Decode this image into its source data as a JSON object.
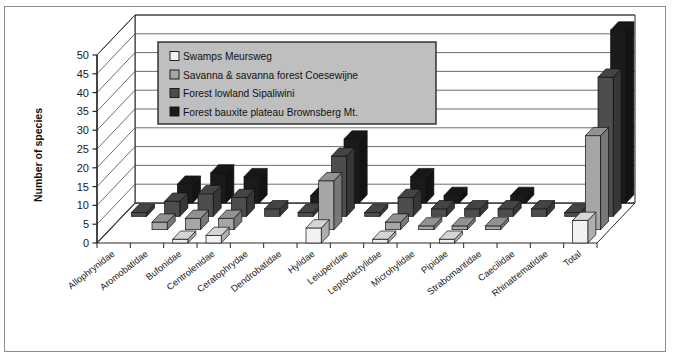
{
  "chart_data": {
    "type": "bar",
    "title": "",
    "subtitle": "",
    "xlabel": "",
    "ylabel": "Number of species",
    "ylim": [
      0,
      50
    ],
    "ytick_step": 5,
    "yticks": [
      0,
      5,
      10,
      15,
      20,
      25,
      30,
      35,
      40,
      45,
      50
    ],
    "grid": true,
    "three_d": true,
    "legend_position": "top-left-inside",
    "categories": [
      "Allophrynidae",
      "Aromobatidae",
      "Bufonidae",
      "Centrolenidae",
      "Ceratophrydae",
      "Dendrobatidae",
      "Hylidae",
      "Leiuperidae",
      "Leptodactylidae",
      "Microhylidae",
      "Pipidae",
      "Strabomantidae",
      "Caecilidae",
      "Rhinatrematidae",
      "Total"
    ],
    "series": [
      {
        "name": "Swamps Meursweg",
        "color": "#f2f2f2",
        "values": [
          0,
          0,
          1,
          2,
          0,
          0,
          4,
          0,
          1,
          0,
          1,
          0,
          0,
          0,
          6
        ]
      },
      {
        "name": "Savanna & savanna forest Coesewijne",
        "color": "#a6a6a6",
        "values": [
          0,
          2,
          3,
          3,
          0,
          0,
          13,
          0,
          2,
          1,
          1,
          1,
          0,
          0,
          25
        ]
      },
      {
        "name": "Forest lowland Sipaliwini",
        "color": "#4d4d4d",
        "values": [
          1,
          4,
          6,
          5,
          2,
          1,
          16,
          1,
          5,
          2,
          2,
          2,
          2,
          1,
          37
        ]
      },
      {
        "name": "Forest bauxite plateau Brownsberg Mt.",
        "color": "#1a1a1a",
        "values": [
          0,
          5,
          8,
          7,
          0,
          2,
          17,
          0,
          7,
          2,
          0,
          2,
          0,
          0,
          46
        ]
      }
    ]
  },
  "legend": {
    "items": [
      "Swamps Meursweg",
      "Savanna & savanna forest Coesewijne",
      "Forest lowland Sipaliwini",
      "Forest bauxite plateau Brownsberg Mt."
    ],
    "background": "#bfbfbf",
    "border": "#1a1a1a"
  },
  "axes": {
    "y_title": "Number of species",
    "y_tick_labels": [
      "0",
      "5",
      "10",
      "15",
      "20",
      "25",
      "30",
      "35",
      "40",
      "45",
      "50"
    ],
    "x_tick_labels": [
      "Allophrynidae",
      "Aromobatidae",
      "Bufonidae",
      "Centrolenidae",
      "Ceratophrydae",
      "Dendrobatidae",
      "Hylidae",
      "Leiuperidae",
      "Leptodactylidae",
      "Microhylidae",
      "Pipidae",
      "Strabomantidae",
      "Caecilidae",
      "Rhinatrematidae",
      "Total"
    ]
  },
  "style": {
    "frame_border": "#8c8c8c",
    "plot_background": "#ffffff",
    "gridline_color": "#404040",
    "axis_color": "#262626",
    "text_color": "#1a1a1a"
  }
}
